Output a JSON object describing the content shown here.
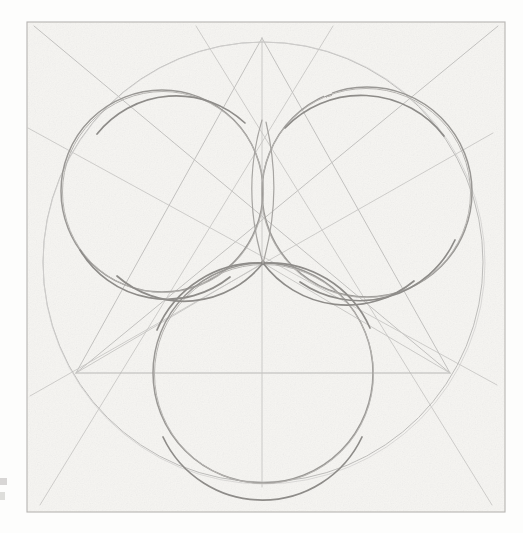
{
  "canvas": {
    "width": 523,
    "height": 533,
    "background_color": "#fdfdfc",
    "paper_color": "#f6f5f2",
    "description": "Hand-drawn pencil geometric construction on textured paper"
  },
  "frame": {
    "name": "drawing-frame",
    "x": 27,
    "y": 22,
    "width": 478,
    "height": 490,
    "stroke_color": "#b6b4b1",
    "stroke_width": 1.1
  },
  "palette": {
    "outer_circle_stroke": "#bdbcba",
    "petal_circle_stroke": "#9a9895",
    "construction_line_stroke": "#c2c1bf",
    "faint_line_stroke": "#cfcecc",
    "paper_tint": "#f6f5f2",
    "frame_stroke": "#b6b4b1"
  },
  "geometry": {
    "center_point": {
      "name": "convergence-point",
      "x": 263,
      "y": 263
    },
    "outer_circle": {
      "name": "outer-circumscribing-circle",
      "cx": 263,
      "cy": 262,
      "r": 220,
      "stroke": "#bdbcba",
      "stroke_width": 1.0
    },
    "petal_circles": [
      {
        "name": "petal-circle-left",
        "cx": 162,
        "cy": 191,
        "r": 101,
        "stroke": "#9a9895",
        "stroke_width": 1.5
      },
      {
        "name": "petal-circle-right",
        "cx": 367,
        "cy": 192,
        "r": 105,
        "stroke": "#9a9895",
        "stroke_width": 1.5
      },
      {
        "name": "petal-circle-bottom",
        "cx": 263,
        "cy": 373,
        "r": 110,
        "stroke": "#9a9895",
        "stroke_width": 1.5
      }
    ],
    "triangle": {
      "name": "inscribed-triangle",
      "apex": {
        "x": 262,
        "y": 38
      },
      "left_vertex": {
        "x": 76,
        "y": 373
      },
      "right_vertex": {
        "x": 450,
        "y": 373
      },
      "stroke": "#c2c1bf",
      "stroke_width": 1.0
    },
    "axis_lines": [
      {
        "name": "vertical-axis",
        "x1": 262,
        "y1": 38,
        "x2": 262,
        "y2": 487,
        "stroke": "#c6c5c3",
        "stroke_width": 0.9
      },
      {
        "name": "horizontal-chord",
        "x1": 76,
        "y1": 373,
        "x2": 450,
        "y2": 373,
        "stroke": "#b9b8b6",
        "stroke_width": 1.0
      }
    ],
    "long_diagonals": [
      {
        "name": "diagonal-nw-to-se",
        "x1": 34,
        "y1": 26,
        "x2": 450,
        "y2": 373,
        "stroke": "#c2c1bf",
        "stroke_width": 1.0
      },
      {
        "name": "diagonal-ne-to-sw",
        "x1": 498,
        "y1": 26,
        "x2": 76,
        "y2": 373,
        "stroke": "#c2c1bf",
        "stroke_width": 1.0
      },
      {
        "name": "diagonal-west-to-east-upper",
        "x1": 28,
        "y1": 128,
        "x2": 497,
        "y2": 385,
        "stroke": "#c8c7c5",
        "stroke_width": 0.9
      },
      {
        "name": "diagonal-west-low-to-east-high",
        "x1": 30,
        "y1": 396,
        "x2": 493,
        "y2": 133,
        "stroke": "#c8c7c5",
        "stroke_width": 0.9
      },
      {
        "name": "diagonal-sw-corner-ray",
        "x1": 40,
        "y1": 505,
        "x2": 333,
        "y2": 26,
        "stroke": "#c8c7c5",
        "stroke_width": 0.9
      },
      {
        "name": "diagonal-se-corner-ray",
        "x1": 492,
        "y1": 505,
        "x2": 196,
        "y2": 26,
        "stroke": "#c8c7c5",
        "stroke_width": 0.9
      }
    ],
    "center_rays": [
      {
        "name": "ray-center-to-left-vertex",
        "x2": 76,
        "y2": 373
      },
      {
        "name": "ray-center-to-right-vertex",
        "x2": 450,
        "y2": 373
      },
      {
        "name": "ray-center-to-apex",
        "x2": 262,
        "y2": 38
      }
    ]
  },
  "edge_marks": [
    {
      "name": "page-edge-artifact-upper",
      "label": ""
    },
    {
      "name": "page-edge-artifact-lower",
      "label": ""
    }
  ]
}
